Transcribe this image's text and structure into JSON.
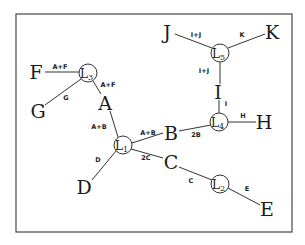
{
  "diagram": {
    "frame": {
      "x": 16,
      "y": 14,
      "width": 276,
      "height": 218
    },
    "hubs": [
      {
        "id": "L1",
        "letter": "L",
        "sub": "1",
        "x": 123,
        "y": 145
      },
      {
        "id": "L2",
        "letter": "L",
        "sub": "2",
        "x": 220,
        "y": 184
      },
      {
        "id": "L3",
        "letter": "L",
        "sub": "3",
        "x": 88,
        "y": 73
      },
      {
        "id": "L4",
        "letter": "L",
        "sub": "4",
        "x": 219,
        "y": 122
      },
      {
        "id": "L5",
        "letter": "L",
        "sub": "5",
        "x": 220,
        "y": 53
      }
    ],
    "nodes": [
      {
        "id": "A",
        "label": "A",
        "x": 105,
        "y": 103
      },
      {
        "id": "B",
        "label": "B",
        "x": 171,
        "y": 133
      },
      {
        "id": "C",
        "label": "C",
        "x": 171,
        "y": 162
      },
      {
        "id": "D",
        "label": "D",
        "x": 84,
        "y": 187
      },
      {
        "id": "E",
        "label": "E",
        "x": 267,
        "y": 209
      },
      {
        "id": "F",
        "label": "F",
        "x": 36,
        "y": 72
      },
      {
        "id": "G",
        "label": "G",
        "x": 38,
        "y": 111
      },
      {
        "id": "H",
        "label": "H",
        "x": 264,
        "y": 122
      },
      {
        "id": "I",
        "label": "I",
        "x": 218,
        "y": 92
      },
      {
        "id": "J",
        "label": "J",
        "x": 167,
        "y": 32
      },
      {
        "id": "K",
        "label": "K",
        "x": 272,
        "y": 32
      }
    ],
    "edges": [
      {
        "from": "F",
        "to": "L3",
        "label": "A+F",
        "lx": 60,
        "ly": 69
      },
      {
        "from": "G",
        "to": "L3",
        "label": "G",
        "lx": 66,
        "ly": 100
      },
      {
        "from": "L3",
        "to": "A",
        "label": "A+F",
        "lx": 108,
        "ly": 87
      },
      {
        "from": "A",
        "to": "L1",
        "label": "A+B",
        "lx": 99,
        "ly": 129
      },
      {
        "from": "L1",
        "to": "B",
        "label": "A+B",
        "lx": 148,
        "ly": 135
      },
      {
        "from": "L1",
        "to": "C",
        "label": "2C",
        "lx": 146,
        "ly": 160
      },
      {
        "from": "L1",
        "to": "D",
        "label": "D",
        "lx": 98,
        "ly": 162
      },
      {
        "from": "B",
        "to": "L4",
        "label": "2B",
        "lx": 196,
        "ly": 137
      },
      {
        "from": "L4",
        "to": "H",
        "label": "H",
        "lx": 243,
        "ly": 118
      },
      {
        "from": "I",
        "to": "L4",
        "label": "I",
        "lx": 226,
        "ly": 106
      },
      {
        "from": "L5",
        "to": "I",
        "label": "I+J",
        "lx": 204,
        "ly": 73
      },
      {
        "from": "J",
        "to": "L5",
        "label": "I+J",
        "lx": 196,
        "ly": 37
      },
      {
        "from": "K",
        "to": "L5",
        "label": "K",
        "lx": 242,
        "ly": 37
      },
      {
        "from": "C",
        "to": "L2",
        "label": "C",
        "lx": 191,
        "ly": 183
      },
      {
        "from": "L2",
        "to": "E",
        "label": "E",
        "lx": 247,
        "ly": 191
      }
    ],
    "segments": [
      {
        "x1": 45,
        "y1": 72,
        "x2": 79,
        "y2": 72
      },
      {
        "x1": 45,
        "y1": 105,
        "x2": 81,
        "y2": 79
      },
      {
        "x1": 93,
        "y1": 81,
        "x2": 101,
        "y2": 94
      },
      {
        "x1": 110,
        "y1": 111,
        "x2": 118,
        "y2": 137
      },
      {
        "x1": 132,
        "y1": 143,
        "x2": 163,
        "y2": 133
      },
      {
        "x1": 131,
        "y1": 149,
        "x2": 163,
        "y2": 158
      },
      {
        "x1": 116,
        "y1": 151,
        "x2": 92,
        "y2": 180
      },
      {
        "x1": 179,
        "y1": 131,
        "x2": 211,
        "y2": 125
      },
      {
        "x1": 228,
        "y1": 122,
        "x2": 256,
        "y2": 122
      },
      {
        "x1": 219,
        "y1": 100,
        "x2": 219,
        "y2": 113
      },
      {
        "x1": 220,
        "y1": 62,
        "x2": 220,
        "y2": 84
      },
      {
        "x1": 175,
        "y1": 34,
        "x2": 212,
        "y2": 48
      },
      {
        "x1": 265,
        "y1": 34,
        "x2": 228,
        "y2": 48
      },
      {
        "x1": 179,
        "y1": 167,
        "x2": 212,
        "y2": 180
      },
      {
        "x1": 228,
        "y1": 188,
        "x2": 260,
        "y2": 205
      }
    ]
  }
}
